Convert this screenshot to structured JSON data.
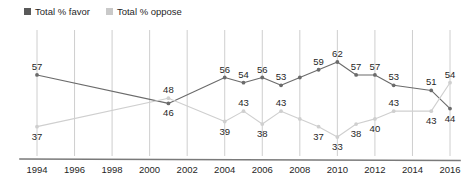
{
  "legend": {
    "position": "top-left",
    "items": [
      {
        "label": "Total % favor",
        "color": "#595959",
        "name": "favor"
      },
      {
        "label": "Total % oppose",
        "color": "#c9c9c9",
        "name": "oppose"
      }
    ]
  },
  "colors": {
    "favor_line": "#6b6b6b",
    "oppose_line": "#cfcfcf",
    "gridline": "#c8c8c8",
    "axis": "#7a7a7a",
    "text": "#1f1f1f",
    "background": "#ffffff"
  },
  "chart_data": {
    "type": "line",
    "title": "",
    "subtitle": "",
    "xlabel": "",
    "ylabel": "",
    "grid": "vertical-only",
    "legend_position": "top-left",
    "xlim": [
      1994,
      2016
    ],
    "ylim": [
      30,
      64
    ],
    "x": [
      1994,
      2001,
      2004,
      2005,
      2006,
      2007,
      2008,
      2009,
      2010,
      2011,
      2012,
      2013,
      2015,
      2016
    ],
    "xticks": [
      "1994",
      "1996",
      "1998",
      "2000",
      "2002",
      "2004",
      "2006",
      "2008",
      "2010",
      "2012",
      "2014",
      "2016"
    ],
    "xtick_values": [
      1994,
      1996,
      1998,
      2000,
      2002,
      2004,
      2006,
      2008,
      2010,
      2012,
      2014,
      2016
    ],
    "series": [
      {
        "name": "Total % favor",
        "color": "#6b6b6b",
        "points": [
          {
            "x": 1994,
            "y": 57,
            "label": "57",
            "label_pos": "above"
          },
          {
            "x": 2001,
            "y": 46,
            "label": "46",
            "label_pos": "below"
          },
          {
            "x": 2004,
            "y": 56,
            "label": "56",
            "label_pos": "above"
          },
          {
            "x": 2005,
            "y": 54,
            "label": "54",
            "label_pos": "above"
          },
          {
            "x": 2006,
            "y": 56,
            "label": "56",
            "label_pos": "above"
          },
          {
            "x": 2007,
            "y": 53,
            "label": "53",
            "label_pos": "above"
          },
          {
            "x": 2008,
            "y": 56,
            "label": "",
            "label_pos": "above"
          },
          {
            "x": 2009,
            "y": 59,
            "label": "59",
            "label_pos": "above"
          },
          {
            "x": 2010,
            "y": 62,
            "label": "62",
            "label_pos": "above"
          },
          {
            "x": 2011,
            "y": 57,
            "label": "57",
            "label_pos": "above"
          },
          {
            "x": 2012,
            "y": 57,
            "label": "57",
            "label_pos": "above"
          },
          {
            "x": 2013,
            "y": 53,
            "label": "53",
            "label_pos": "above"
          },
          {
            "x": 2015,
            "y": 51,
            "label": "51",
            "label_pos": "above"
          },
          {
            "x": 2016,
            "y": 44,
            "label": "44",
            "label_pos": "below"
          }
        ]
      },
      {
        "name": "Total % oppose",
        "color": "#cfcfcf",
        "points": [
          {
            "x": 1994,
            "y": 37,
            "label": "37",
            "label_pos": "below"
          },
          {
            "x": 2001,
            "y": 48,
            "label": "48",
            "label_pos": "above"
          },
          {
            "x": 2004,
            "y": 39,
            "label": "39",
            "label_pos": "below"
          },
          {
            "x": 2005,
            "y": 43,
            "label": "43",
            "label_pos": "above"
          },
          {
            "x": 2006,
            "y": 38,
            "label": "38",
            "label_pos": "below"
          },
          {
            "x": 2007,
            "y": 43,
            "label": "43",
            "label_pos": "above"
          },
          {
            "x": 2008,
            "y": 40,
            "label": "",
            "label_pos": "below"
          },
          {
            "x": 2009,
            "y": 37,
            "label": "37",
            "label_pos": "below"
          },
          {
            "x": 2010,
            "y": 33,
            "label": "33",
            "label_pos": "below"
          },
          {
            "x": 2011,
            "y": 38,
            "label": "38",
            "label_pos": "below"
          },
          {
            "x": 2012,
            "y": 40,
            "label": "40",
            "label_pos": "below"
          },
          {
            "x": 2013,
            "y": 43,
            "label": "43",
            "label_pos": "above"
          },
          {
            "x": 2015,
            "y": 43,
            "label": "43",
            "label_pos": "below"
          },
          {
            "x": 2016,
            "y": 54,
            "label": "54",
            "label_pos": "above"
          }
        ]
      }
    ]
  }
}
